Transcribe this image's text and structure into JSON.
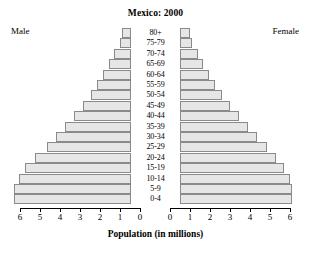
{
  "chart_data": {
    "type": "bar",
    "subtype": "population-pyramid",
    "title": "Mexico: 2000",
    "xlabel": "Population (in millions)",
    "ylabel": "",
    "left_label": "Male",
    "right_label": "Female",
    "categories": [
      "0-4",
      "5-9",
      "10-14",
      "15-19",
      "20-24",
      "25-29",
      "30-34",
      "35-39",
      "40-44",
      "45-49",
      "50-54",
      "55-59",
      "60-64",
      "65-69",
      "70-74",
      "75-79",
      "80+"
    ],
    "axis_ticks_left": [
      "6",
      "5",
      "4",
      "3",
      "2",
      "1",
      "0"
    ],
    "axis_ticks_right": [
      "0",
      "1",
      "2",
      "3",
      "4",
      "5",
      "6"
    ],
    "xlim": [
      0,
      6
    ],
    "grid": false,
    "legend": "none",
    "series": [
      {
        "name": "Male",
        "side": "left",
        "values": [
          5.85,
          5.85,
          5.6,
          5.3,
          4.8,
          4.2,
          3.75,
          3.3,
          2.85,
          2.4,
          2.0,
          1.7,
          1.4,
          1.1,
          0.85,
          0.55,
          0.45
        ]
      },
      {
        "name": "Female",
        "side": "right",
        "values": [
          5.6,
          5.6,
          5.5,
          5.2,
          4.8,
          4.35,
          3.85,
          3.4,
          2.95,
          2.5,
          2.1,
          1.75,
          1.45,
          1.15,
          0.9,
          0.6,
          0.5
        ]
      }
    ],
    "colors": {
      "bar_fill": "#e6e6e6",
      "bar_stroke": "#8a8a8a",
      "axis": "#000000",
      "text": "#000000",
      "background": "#ffffff"
    }
  }
}
